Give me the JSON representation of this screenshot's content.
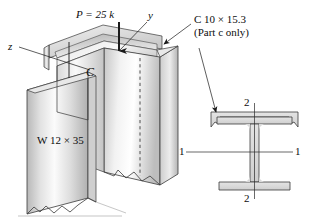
{
  "figure": {
    "labels": {
      "load": "P = 25 k",
      "load_symbol": "P",
      "load_value": "= 25 k",
      "axis_y": "y",
      "axis_z": "z",
      "centroid": "C",
      "channel_designation": "C 10 × 15.3",
      "channel_note": "(Part c only)",
      "wide_flange_designation": "W 12 × 35",
      "section_axis_2_top": "2",
      "section_axis_2_bottom": "2",
      "section_axis_1_left": "1",
      "section_axis_1_right": "1"
    },
    "colors": {
      "outline": "#2b2b2b",
      "steel_light": "#f4f4f4",
      "steel_mid": "#d2d2d2",
      "steel_dark": "#a9a9a9",
      "section_fill": "#d9d9d9",
      "text": "#0d0d0d",
      "background": "#ffffff"
    }
  }
}
